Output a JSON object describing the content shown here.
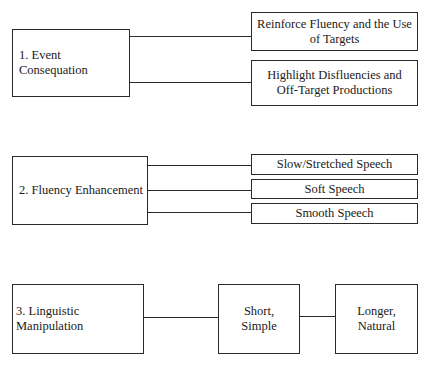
{
  "sections": [
    {
      "main": "1.  Event Consequation",
      "branches": [
        "Reinforce Fluency and the Use of Targets",
        "Highlight Disfluencies and Off-Target Productions"
      ]
    },
    {
      "main": "2.  Fluency Enhancement",
      "branches": [
        "Slow/Stretched Speech",
        "Soft Speech",
        "Smooth Speech"
      ]
    },
    {
      "main": "3.  Linguistic Manipulation",
      "steps": [
        "Short, Simple",
        "Longer, Natural"
      ]
    }
  ]
}
